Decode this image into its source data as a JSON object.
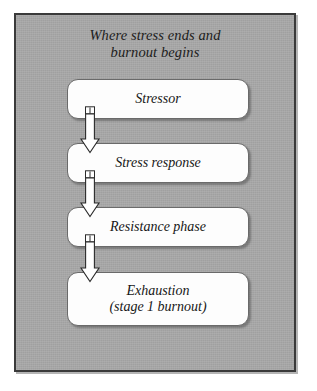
{
  "figure": {
    "title_lines": [
      "Where stress ends and",
      "burnout begins"
    ],
    "background_color": "#a9a9a9",
    "frame_border_color": "#3a3a3a",
    "box_fill_color": "#fdfdfd",
    "box_border_color": "#6a6a6a",
    "text_color": "#171717"
  },
  "stages": [
    {
      "id": "stressor",
      "label": "Stressor",
      "sublabel": ""
    },
    {
      "id": "response",
      "label": "Stress response",
      "sublabel": ""
    },
    {
      "id": "resistance",
      "label": "Resistance phase",
      "sublabel": ""
    },
    {
      "id": "exhaustion",
      "label": "Exhaustion",
      "sublabel": "(stage 1 burnout)"
    }
  ],
  "connectors": [
    {
      "id": "arrow-1",
      "from": "stressor",
      "to": "response",
      "direction": "down"
    },
    {
      "id": "arrow-2",
      "from": "response",
      "to": "resistance",
      "direction": "down"
    },
    {
      "id": "arrow-3",
      "from": "resistance",
      "to": "exhaustion",
      "direction": "down"
    }
  ]
}
